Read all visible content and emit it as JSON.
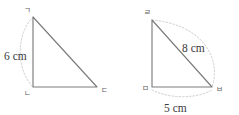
{
  "figure": {
    "stroke_color": "#7c7c7c",
    "arc_color": "#cfcfcf",
    "label_color": "#3a3a3a",
    "vertex_label_color": "#5e5e5e",
    "background": "#ffffff"
  },
  "triangles": [
    {
      "name": "triangle-left",
      "vertices": [
        {
          "key": "apex",
          "label": "ㄱ",
          "x": 33,
          "y": 17
        },
        {
          "key": "bottom_left",
          "label": "ㄴ",
          "x": 33,
          "y": 87
        },
        {
          "key": "bottom_right",
          "label": "ㄷ",
          "x": 97,
          "y": 87
        }
      ],
      "measures": [
        {
          "key": "vertical_side",
          "label": "6 cm",
          "x": 4,
          "y": 56
        }
      ]
    },
    {
      "name": "triangle-right",
      "vertices": [
        {
          "key": "apex",
          "label": "ㄹ",
          "x": 152,
          "y": 20
        },
        {
          "key": "bottom_left",
          "label": "ㅁ",
          "x": 152,
          "y": 87
        },
        {
          "key": "bottom_right",
          "label": "ㅂ",
          "x": 212,
          "y": 87
        }
      ],
      "measures": [
        {
          "key": "hypotenuse",
          "label": "8 cm",
          "x": 182,
          "y": 48
        },
        {
          "key": "base",
          "label": "5 cm",
          "x": 164,
          "y": 108
        }
      ]
    }
  ]
}
